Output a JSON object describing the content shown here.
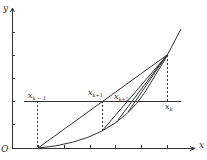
{
  "diagram": {
    "axes": {
      "x_label": "x",
      "y_label": "y",
      "origin_label": "O"
    },
    "points": {
      "xk_minus_1": {
        "base": "x",
        "sub": "k − 1"
      },
      "xk_plus_1": {
        "base": "x",
        "sub": "k+1"
      },
      "xk_plus_2": {
        "base": "x",
        "sub": "k+2"
      },
      "xk": {
        "base": "x",
        "sub": "k"
      }
    },
    "colors": {
      "line": "#333333",
      "background": "#ffffff"
    }
  }
}
